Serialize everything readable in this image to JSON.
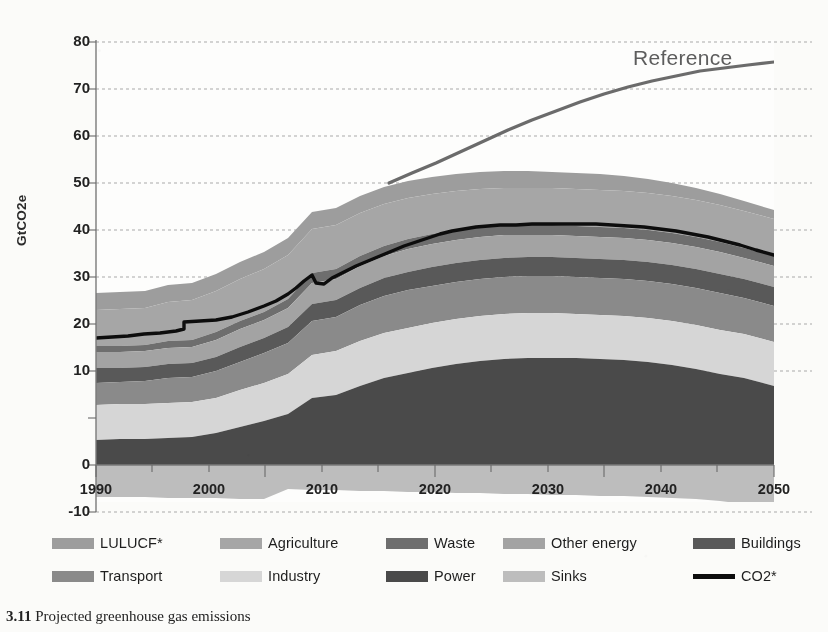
{
  "figure": {
    "caption_number": "3.11",
    "caption_text": "Projected greenhouse gas emissions"
  },
  "annotations": {
    "reference_label": "Reference"
  },
  "legend": {
    "rows": [
      [
        {
          "label": "LULUCF*",
          "type": "swatch",
          "color": "#9d9d9d",
          "x": 0,
          "sw": 42
        },
        {
          "label": "Agriculture",
          "type": "swatch",
          "color": "#a6a6a6",
          "x": 168,
          "sw": 42
        },
        {
          "label": "Waste",
          "type": "swatch",
          "color": "#6e6e6e",
          "x": 334,
          "sw": 42
        },
        {
          "label": "Other energy",
          "type": "swatch",
          "color": "#a3a3a3",
          "x": 451,
          "sw": 42
        },
        {
          "label": "Buildings",
          "type": "swatch",
          "color": "#595959",
          "x": 641,
          "sw": 42
        }
      ],
      [
        {
          "label": "Transport",
          "type": "swatch",
          "color": "#8a8a8a",
          "x": 0,
          "sw": 42
        },
        {
          "label": "Industry",
          "type": "swatch",
          "color": "#d6d6d6",
          "x": 168,
          "sw": 42
        },
        {
          "label": "Power",
          "type": "swatch",
          "color": "#4a4a4a",
          "x": 334,
          "sw": 42
        },
        {
          "label": "Sinks",
          "type": "swatch",
          "color": "#bdbdbd",
          "x": 451,
          "sw": 42
        },
        {
          "label": "CO2*",
          "type": "line",
          "color": "#0d0d0d",
          "x": 641,
          "sw": 42
        }
      ]
    ]
  },
  "chart_data": {
    "type": "area",
    "title": "Projected greenhouse gas emissions",
    "xlabel": "",
    "ylabel": "GtCO2e",
    "xlim": [
      1990,
      2050
    ],
    "ylim": [
      -10,
      80
    ],
    "ytick_labels": [
      "80",
      "70",
      "60",
      "50",
      "40",
      "30",
      "20",
      "10",
      "0",
      "-10"
    ],
    "ytick_values": [
      80,
      70,
      60,
      50,
      40,
      30,
      20,
      10,
      0,
      -10
    ],
    "xtick_labels": [
      "1990",
      "2000",
      "2010",
      "2020",
      "2030",
      "2040",
      "2050"
    ],
    "xtick_values": [
      1990,
      2000,
      2010,
      2020,
      2030,
      2040,
      2050
    ],
    "grid": "horizontal-dotted",
    "legend_position": "below",
    "stacking": "bottom-to-top",
    "x": [
      1990,
      1995,
      2000,
      2005,
      2010,
      2015,
      2020,
      2025,
      2030,
      2035,
      2040,
      2045,
      2050
    ],
    "series": [
      {
        "name": "Sinks",
        "color": "#bdbdbd",
        "stack": "negative",
        "values": [
          -6.8,
          -6.8,
          -6.9,
          -7.0,
          -7.1,
          -7.2,
          -7.3,
          -7.4,
          -7.5,
          -7.6,
          -7.8,
          -8.3,
          -9.2
        ]
      },
      {
        "name": "Power",
        "color": "#4a4a4a",
        "stack": "positive",
        "values": [
          6.9,
          7.5,
          8.4,
          9.6,
          11.4,
          11.8,
          12.6,
          13.4,
          13.7,
          13.4,
          12.8,
          12.2,
          11.2
        ]
      },
      {
        "name": "Industry",
        "color": "#d6d6d6",
        "stack": "positive",
        "values": [
          6.3,
          6.0,
          6.2,
          7.0,
          7.8,
          8.4,
          9.1,
          9.6,
          9.8,
          9.8,
          9.7,
          9.5,
          9.3
        ]
      },
      {
        "name": "Transport",
        "color": "#8a8a8a",
        "stack": "positive",
        "values": [
          4.6,
          4.9,
          5.3,
          5.9,
          6.3,
          6.8,
          7.2,
          7.5,
          7.7,
          7.8,
          7.8,
          7.8,
          7.7
        ]
      },
      {
        "name": "Buildings",
        "color": "#595959",
        "stack": "positive",
        "values": [
          3.2,
          3.2,
          3.3,
          3.4,
          3.5,
          3.6,
          3.8,
          3.9,
          4.0,
          4.0,
          4.0,
          3.9,
          3.8
        ]
      },
      {
        "name": "Other energy",
        "color": "#a3a3a3",
        "stack": "positive",
        "values": [
          3.4,
          3.3,
          3.4,
          3.7,
          4.0,
          4.3,
          4.6,
          4.8,
          4.9,
          4.9,
          4.8,
          4.7,
          4.5
        ]
      },
      {
        "name": "Waste",
        "color": "#6e6e6e",
        "stack": "positive",
        "values": [
          1.3,
          1.3,
          1.4,
          1.5,
          1.6,
          1.7,
          1.8,
          1.9,
          1.9,
          2.0,
          2.0,
          2.0,
          2.0
        ]
      },
      {
        "name": "Agriculture",
        "color": "#a6a6a6",
        "stack": "positive",
        "values": [
          5.6,
          5.7,
          5.9,
          6.2,
          6.5,
          6.9,
          7.2,
          7.5,
          7.7,
          7.8,
          7.9,
          7.9,
          7.9
        ]
      },
      {
        "name": "LULUCF*",
        "color": "#9d9d9d",
        "stack": "positive",
        "values": [
          5.2,
          5.2,
          5.3,
          5.4,
          5.4,
          5.3,
          5.2,
          5.0,
          4.8,
          4.6,
          4.4,
          4.2,
          4.0
        ]
      }
    ],
    "lines": [
      {
        "name": "CO2*",
        "color": "#0d0d0d",
        "width": 3.2,
        "values": [
          27.0,
          27.6,
          28.8,
          31.4,
          34.5,
          36.2,
          38.4,
          40.6,
          42.8,
          43.6,
          43.9,
          43.9,
          43.6,
          42.9,
          41.4,
          40.0
        ]
      },
      {
        "name": "Reference",
        "color": "#6b6b6b",
        "width": 3.0,
        "values": [
          48.5,
          50.0,
          52.3,
          55.0,
          57.8,
          60.4,
          63.0,
          65.3,
          67.4,
          69.2,
          70.7,
          71.9,
          72.6,
          73.0
        ]
      }
    ]
  }
}
